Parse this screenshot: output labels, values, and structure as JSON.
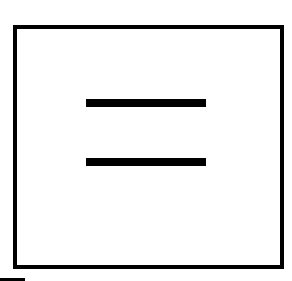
{
  "diagram": {
    "symbol": "equals-sign-in-square",
    "frame": {
      "shape": "square-outline",
      "color": "#000000"
    },
    "bars": [
      {
        "position": "top",
        "color": "#000000"
      },
      {
        "position": "bottom",
        "color": "#000000"
      }
    ],
    "background": "#ffffff"
  }
}
